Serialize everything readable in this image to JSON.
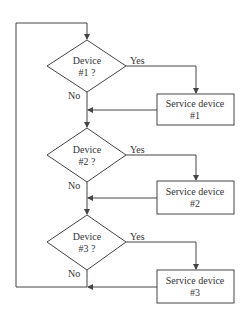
{
  "diagram": {
    "type": "flowchart",
    "decisions": [
      {
        "line1": "Device",
        "line2": "#1 ?",
        "yes": "Yes",
        "no": "No"
      },
      {
        "line1": "Device",
        "line2": "#2 ?",
        "yes": "Yes",
        "no": "No"
      },
      {
        "line1": "Device",
        "line2": "#3 ?",
        "yes": "Yes",
        "no": "No"
      }
    ],
    "processes": [
      {
        "line1": "Service device",
        "line2": "#1"
      },
      {
        "line1": "Service device",
        "line2": "#2"
      },
      {
        "line1": "Service device",
        "line2": "#3"
      }
    ],
    "colors": {
      "stroke": "#444444",
      "text": "#333333",
      "background": "#ffffff"
    }
  }
}
